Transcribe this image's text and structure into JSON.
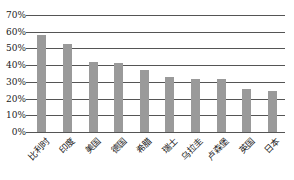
{
  "chart_data": {
    "type": "bar",
    "title": "",
    "xlabel": "",
    "ylabel": "",
    "categories": [
      "比利时",
      "印度",
      "美国",
      "德国",
      "希腊",
      "瑞士",
      "乌拉圭",
      "卢森堡",
      "英国",
      "日本"
    ],
    "values": [
      58,
      52.5,
      42,
      41,
      37,
      33,
      32,
      32,
      26,
      24.5
    ],
    "value_unit": "%",
    "ylim": [
      0,
      70
    ],
    "yticks": [
      "0%",
      "10%",
      "20%",
      "30%",
      "40%",
      "50%",
      "60%",
      "70%"
    ],
    "grid": true,
    "legend": null,
    "bar_color": "#9a9a9a",
    "grid_color": "#555555"
  }
}
